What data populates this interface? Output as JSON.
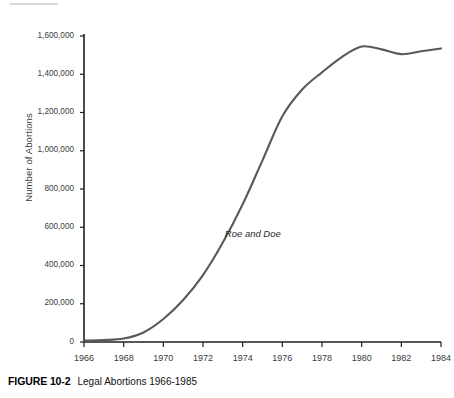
{
  "chart_data": {
    "type": "line",
    "title": "",
    "xlabel": "",
    "ylabel": "Number of Abortions",
    "xlim": [
      1966,
      1984
    ],
    "ylim": [
      0,
      1600000
    ],
    "grid": false,
    "legend": "none",
    "x_ticks": [
      "1966",
      "1968",
      "1970",
      "1972",
      "1974",
      "1976",
      "1978",
      "1980",
      "1982",
      "1984"
    ],
    "y_ticks": [
      "0",
      "200,000",
      "400,000",
      "600,000",
      "800,000",
      "1,000,000",
      "1,200,000",
      "1,400,000",
      "1,600,000"
    ],
    "y_tick_values": [
      0,
      200000,
      400000,
      600000,
      800000,
      1000000,
      1200000,
      1400000,
      1600000
    ],
    "series": [
      {
        "name": "Legal Abortions",
        "color": "#595959",
        "x": [
          1966,
          1967,
          1968,
          1969,
          1970,
          1971,
          1972,
          1973,
          1974,
          1975,
          1976,
          1977,
          1978,
          1979,
          1980,
          1981,
          1982,
          1983,
          1984
        ],
        "values": [
          8000,
          10000,
          18000,
          50000,
          120000,
          220000,
          350000,
          520000,
          720000,
          950000,
          1180000,
          1320000,
          1410000,
          1490000,
          1545000,
          1530000,
          1505000,
          1520000,
          1535000
        ]
      }
    ],
    "annotations": [
      {
        "text": "Roe and Doe",
        "x": 1973.1,
        "y": 560000,
        "style": "italic"
      }
    ]
  },
  "caption": {
    "label": "FIGURE 10-2",
    "text": "Legal Abortions 1966-1985"
  },
  "colors": {
    "curve": "#595959",
    "axis": "#1f1f1f",
    "tick_text": "#3b3b3b",
    "top_rule": "#d8d8d8",
    "background": "#ffffff"
  }
}
